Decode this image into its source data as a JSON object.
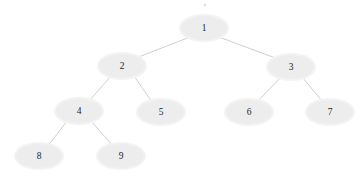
{
  "diagram": {
    "type": "binary-tree",
    "title": "",
    "background_color": "#ffffff",
    "node_fill_color": "#ededed",
    "node_halo_color": "#f3f3f3",
    "edge_color": "#c9c9c9",
    "label_color": "#262626",
    "node_rx": 23,
    "node_ry": 12,
    "nodes": [
      {
        "id": "n1",
        "label": "1",
        "cx": 204,
        "cy": 28,
        "level": 0
      },
      {
        "id": "n2",
        "label": "2",
        "cx": 122,
        "cy": 66,
        "level": 1
      },
      {
        "id": "n3",
        "label": "3",
        "cx": 291,
        "cy": 67,
        "level": 1
      },
      {
        "id": "n4",
        "label": "4",
        "cx": 79,
        "cy": 111,
        "level": 2
      },
      {
        "id": "n5",
        "label": "5",
        "cx": 161,
        "cy": 112,
        "level": 2
      },
      {
        "id": "n6",
        "label": "6",
        "cx": 249,
        "cy": 112,
        "level": 2
      },
      {
        "id": "n7",
        "label": "7",
        "cx": 330,
        "cy": 112,
        "level": 2
      },
      {
        "id": "n8",
        "label": "8",
        "cx": 39,
        "cy": 156,
        "level": 3
      },
      {
        "id": "n9",
        "label": "9",
        "cx": 121,
        "cy": 156,
        "level": 3
      }
    ],
    "edges": [
      {
        "from": "n1",
        "to": "n2",
        "x1": 190,
        "y1": 37,
        "x2": 136,
        "y2": 58
      },
      {
        "from": "n1",
        "to": "n3",
        "x1": 219,
        "y1": 37,
        "x2": 278,
        "y2": 59
      },
      {
        "from": "n2",
        "to": "n4",
        "x1": 111,
        "y1": 76,
        "x2": 89,
        "y2": 101
      },
      {
        "from": "n2",
        "to": "n5",
        "x1": 134,
        "y1": 76,
        "x2": 152,
        "y2": 102
      },
      {
        "from": "n3",
        "to": "n6",
        "x1": 281,
        "y1": 77,
        "x2": 257,
        "y2": 102
      },
      {
        "from": "n3",
        "to": "n7",
        "x1": 302,
        "y1": 77,
        "x2": 323,
        "y2": 102
      },
      {
        "from": "n4",
        "to": "n8",
        "x1": 67,
        "y1": 121,
        "x2": 48,
        "y2": 146
      },
      {
        "from": "n4",
        "to": "n9",
        "x1": 91,
        "y1": 121,
        "x2": 113,
        "y2": 146
      }
    ],
    "artifacts": [
      {
        "name": "speck",
        "cx": 205,
        "cy": 5,
        "r": 1.2
      }
    ]
  }
}
